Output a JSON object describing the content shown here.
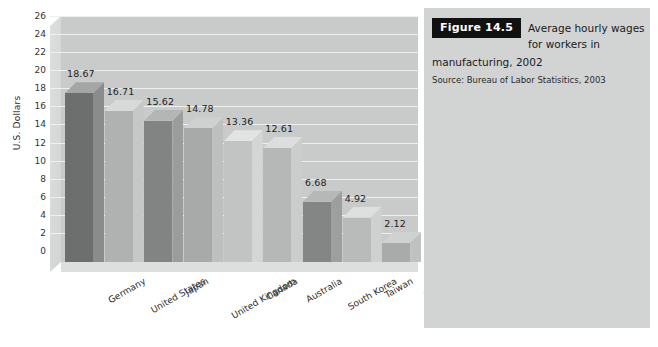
{
  "figure": {
    "badge_label": "Figure 14.5",
    "caption_line1": "Average hourly wages",
    "caption_line2": "for workers in",
    "caption_line3": "manufacturing, 2002",
    "source": "Source: Bureau of Labor Statisitics, 2003",
    "panel_color": "#d2d4d4",
    "badge_bg": "#111111",
    "badge_fg": "#ffffff"
  },
  "chart_data": {
    "type": "bar",
    "title": "Average hourly wages for workers in manufacturing, 2002",
    "xlabel": "",
    "ylabel": "U.S. Dollars",
    "ylim": [
      0,
      26
    ],
    "ytick_step": 2,
    "grid": true,
    "legend": "none",
    "three_d": true,
    "categories": [
      "Germany",
      "United States",
      "Japan",
      "United Kingdom",
      "Canada",
      "Australia",
      "South Korea",
      "Taiwan",
      "Mexico"
    ],
    "values": [
      18.67,
      16.71,
      15.62,
      14.78,
      13.36,
      12.61,
      6.68,
      4.92,
      2.12
    ],
    "value_labels": [
      "18.67",
      "16.71",
      "15.62",
      "14.78",
      "13.36",
      "12.61",
      "6.68",
      "4.92",
      "2.12"
    ],
    "ytick_labels": [
      "0",
      "2",
      "4",
      "6",
      "8",
      "10",
      "12",
      "14",
      "16",
      "18",
      "20",
      "22",
      "24",
      "26"
    ],
    "bar_colors": [
      "#6d6f6f",
      "#b0b2b2",
      "#828484",
      "#a8aaaa",
      "#c2c4c4",
      "#b6b8b8",
      "#848686",
      "#b9bbbb",
      "#a9abab"
    ],
    "bar_top_colors": [
      "#a4a6a6",
      "#d8dada",
      "#b4b6b6",
      "#cfd1d1",
      "#e2e4e4",
      "#dcdede",
      "#b6b8b8",
      "#dedfdf",
      "#d0d2d2"
    ],
    "bar_side_colors": [
      "#8a8c8c",
      "#c6c8c8",
      "#9b9d9d",
      "#bec0c0",
      "#d4d6d6",
      "#cbcdcd",
      "#9d9f9f",
      "#cfd1d1",
      "#c0c2c2"
    ],
    "plot_bg": "#c9cbcb",
    "gridline_color": "#eef0f0"
  }
}
